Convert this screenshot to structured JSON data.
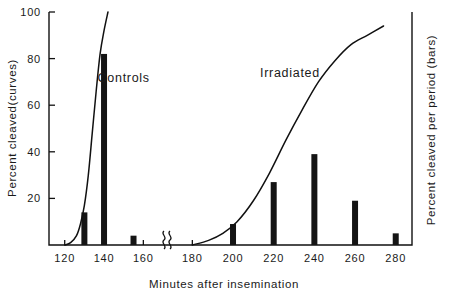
{
  "chart_data": {
    "type": "bar",
    "title": "",
    "xlabel": "Minutes after insemination",
    "ylabel": "Percent cleaved(curves)",
    "ylabel_right": "Percent cleaved per period (bars)",
    "xlim": [
      112,
      288
    ],
    "ylim": [
      0,
      100
    ],
    "grid": false,
    "legend": "inline-annotations",
    "axis_break": {
      "at_x": 170,
      "between": [
        160,
        180
      ],
      "style": "squiggle"
    },
    "x_ticks": [
      120,
      140,
      160,
      180,
      200,
      220,
      240,
      260,
      280
    ],
    "x_tick_labels": [
      "120",
      "140",
      "160",
      "180",
      "200",
      "220",
      "240",
      "260",
      "280"
    ],
    "y_ticks": [
      20,
      40,
      60,
      80,
      100
    ],
    "y_tick_labels": [
      "20",
      "40",
      "60",
      "80",
      "100"
    ],
    "bars": {
      "name": "Percent cleaved per period",
      "x": [
        130,
        140,
        155,
        200,
        220,
        240,
        260,
        280
      ],
      "values": [
        14,
        82,
        4,
        9,
        27,
        39,
        19,
        5
      ]
    },
    "series": [
      {
        "name": "Controls",
        "type": "line",
        "label_x": 150,
        "label_y": 70,
        "points": [
          [
            120,
            0
          ],
          [
            123,
            1
          ],
          [
            126,
            4
          ],
          [
            128,
            9
          ],
          [
            130,
            17
          ],
          [
            132,
            30
          ],
          [
            134,
            48
          ],
          [
            136,
            66
          ],
          [
            138,
            82
          ],
          [
            140,
            92
          ],
          [
            142,
            100
          ]
        ]
      },
      {
        "name": "Irradiated",
        "type": "line",
        "label_x": 228,
        "label_y": 72,
        "points": [
          [
            180,
            0
          ],
          [
            188,
            2
          ],
          [
            195,
            5
          ],
          [
            202,
            10
          ],
          [
            210,
            19
          ],
          [
            218,
            31
          ],
          [
            226,
            45
          ],
          [
            234,
            58
          ],
          [
            242,
            70
          ],
          [
            250,
            79
          ],
          [
            258,
            86
          ],
          [
            266,
            90
          ],
          [
            274,
            94
          ]
        ]
      }
    ]
  },
  "annotations": {
    "controls_label": "Controls",
    "irradiated_label": "Irradiated"
  }
}
